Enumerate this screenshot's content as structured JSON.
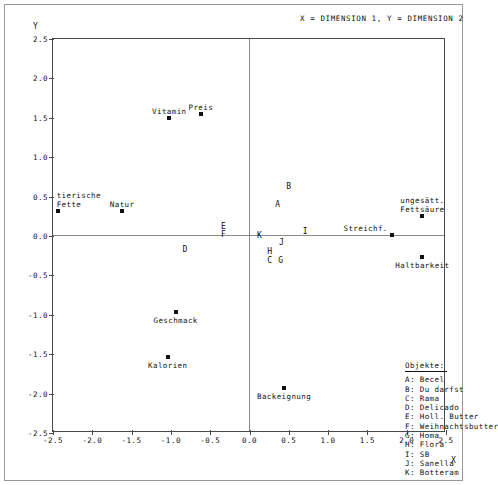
{
  "header": {
    "note": "X = DIMENSION  1,   Y = DIMENSION  2"
  },
  "axes": {
    "ylabel": "Y",
    "xlabel": "X",
    "xticks": [
      "-2.5",
      "-2.0",
      "-1.5",
      "-1.0",
      "-0.5",
      "0.0",
      "0.5",
      "1.0",
      "1.5",
      "2.0",
      "2.5"
    ],
    "yticks": [
      "2.5",
      "2.0",
      "1.5",
      "1.0",
      "0.5",
      "0.0",
      "-0.5",
      "-1.0",
      "-1.5",
      "-2.0",
      "-2.5"
    ]
  },
  "legend": {
    "title": "Objekte:",
    "items": [
      {
        "key": "A",
        "label": "A: Becel"
      },
      {
        "key": "B",
        "label": "B: Du darfst"
      },
      {
        "key": "C",
        "label": "C: Rama"
      },
      {
        "key": "D",
        "label": "D: Delicado"
      },
      {
        "key": "E",
        "label": "E: Holl. Butter"
      },
      {
        "key": "F",
        "label": "F: Weihnachtsbutter"
      },
      {
        "key": "G",
        "label": "G: Homa"
      },
      {
        "key": "H",
        "label": "H: Flora"
      },
      {
        "key": "I",
        "label": "I: SB"
      },
      {
        "key": "J",
        "label": "J: Sanella"
      },
      {
        "key": "K",
        "label": "K: Botteram"
      }
    ]
  },
  "chart_data": {
    "type": "scatter",
    "title": "X = DIMENSION  1,   Y = DIMENSION  2",
    "xlabel": "X",
    "ylabel": "Y",
    "xlim": [
      -2.5,
      2.5
    ],
    "ylim": [
      -2.5,
      2.5
    ],
    "xticks": [
      -2.5,
      -2.0,
      -1.5,
      -1.0,
      -0.5,
      0.0,
      0.5,
      1.0,
      1.5,
      2.0,
      2.5
    ],
    "yticks": [
      -2.5,
      -2.0,
      -1.5,
      -1.0,
      -0.5,
      0.0,
      0.5,
      1.0,
      1.5,
      2.0,
      2.5
    ],
    "grid": false,
    "legend_position": "inside-bottom-right",
    "reference_lines": [
      {
        "axis": "y",
        "value": 0.0
      },
      {
        "axis": "x",
        "value": 0.0
      }
    ],
    "series": [
      {
        "name": "Eigenschaften",
        "marker": "square",
        "color": "#111111",
        "points": [
          {
            "label": "tierische\nFette",
            "x": -2.44,
            "y": 0.32,
            "label_pos": "above-right"
          },
          {
            "label": "Natur",
            "x": -1.62,
            "y": 0.32,
            "label_pos": "above"
          },
          {
            "label": "Vitamin",
            "x": -1.02,
            "y": 1.5,
            "label_pos": "above"
          },
          {
            "label": "Preis",
            "x": -0.62,
            "y": 1.55,
            "label_pos": "above"
          },
          {
            "label": "Geschmack",
            "x": -0.94,
            "y": -0.96,
            "label_pos": "below"
          },
          {
            "label": "Kalorien",
            "x": -1.04,
            "y": -1.54,
            "label_pos": "below"
          },
          {
            "label": "Backeignung",
            "x": 0.44,
            "y": -1.93,
            "label_pos": "below"
          },
          {
            "label": "Streichf.",
            "x": 1.81,
            "y": 0.01,
            "label_pos": "above-left"
          },
          {
            "label": "Haltbarkeit",
            "x": 2.2,
            "y": -0.27,
            "label_pos": "below"
          },
          {
            "label": "ungesätt.\nFettsäure",
            "x": 2.2,
            "y": 0.26,
            "label_pos": "above"
          }
        ]
      },
      {
        "name": "Objekte",
        "marker": "letter",
        "color": "#111111",
        "points": [
          {
            "label": "A",
            "x": 0.36,
            "y": 0.4
          },
          {
            "label": "B",
            "x": 0.5,
            "y": 0.63
          },
          {
            "label": "C",
            "x": 0.26,
            "y": -0.31
          },
          {
            "label": "D",
            "x": -0.82,
            "y": -0.17
          },
          {
            "label": "E",
            "x": -0.33,
            "y": 0.13
          },
          {
            "label": "F",
            "x": -0.33,
            "y": 0.03
          },
          {
            "label": "G",
            "x": 0.4,
            "y": -0.31
          },
          {
            "label": "H",
            "x": 0.26,
            "y": -0.19
          },
          {
            "label": "I",
            "x": 0.71,
            "y": 0.06
          },
          {
            "label": "J",
            "x": 0.41,
            "y": -0.07
          },
          {
            "label": "K",
            "x": 0.13,
            "y": 0.01
          }
        ]
      }
    ]
  }
}
